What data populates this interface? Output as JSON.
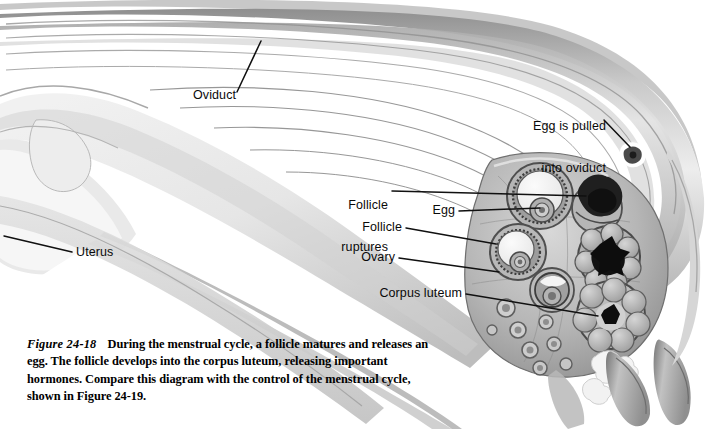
{
  "figure": {
    "id_label": "Figure 24-18",
    "caption_text": "During the menstrual cycle, a follicle matures and releases an egg. The follicle develops into the corpus luteum, releasing important hormones. Compare this diagram with the control of the menstrual cycle, shown in Figure 24-19.",
    "style": "grayscale airbrush anatomical illustration",
    "colors": {
      "page_background": "#ffffff",
      "label_text": "#0a0a0a",
      "caption_text": "#000000",
      "leader_line": "#101010",
      "tissue_light": "#e9e9e9",
      "tissue_mid": "#c4c4c4",
      "tissue_shadow": "#8d8d8d",
      "tissue_dark": "#5d5d5d",
      "follicle_fluid": "#f2f2f2",
      "oocyte_dark": "#1a1a1a"
    }
  },
  "labels": [
    {
      "key": "oviduct",
      "text": "Oviduct",
      "lines": [
        "Oviduct"
      ]
    },
    {
      "key": "uterus",
      "text": "Uterus",
      "lines": [
        "Uterus"
      ]
    },
    {
      "key": "egg-pulled",
      "text": "Egg is pulled into oviduct",
      "lines": [
        "Egg is pulled",
        "into oviduct"
      ]
    },
    {
      "key": "follicle-ruptures",
      "text": "Follicle ruptures",
      "lines": [
        "Follicle",
        "ruptures"
      ]
    },
    {
      "key": "egg",
      "text": "Egg",
      "lines": [
        "Egg"
      ]
    },
    {
      "key": "follicle",
      "text": "Follicle",
      "lines": [
        "Follicle"
      ]
    },
    {
      "key": "ovary",
      "text": "Ovary",
      "lines": [
        "Ovary"
      ]
    },
    {
      "key": "corpus-luteum",
      "text": "Corpus luteum",
      "lines": [
        "Corpus luteum"
      ]
    }
  ],
  "label_text": {
    "oviduct": "Oviduct",
    "uterus": "Uterus",
    "egg_pulled_line1": "Egg is pulled",
    "egg_pulled_line2": "into oviduct",
    "follicle_ruptures_line1": "Follicle",
    "follicle_ruptures_line2": "ruptures",
    "egg": "Egg",
    "follicle": "Follicle",
    "ovary": "Ovary",
    "corpus_luteum": "Corpus luteum"
  },
  "bleed_through": "   "
}
